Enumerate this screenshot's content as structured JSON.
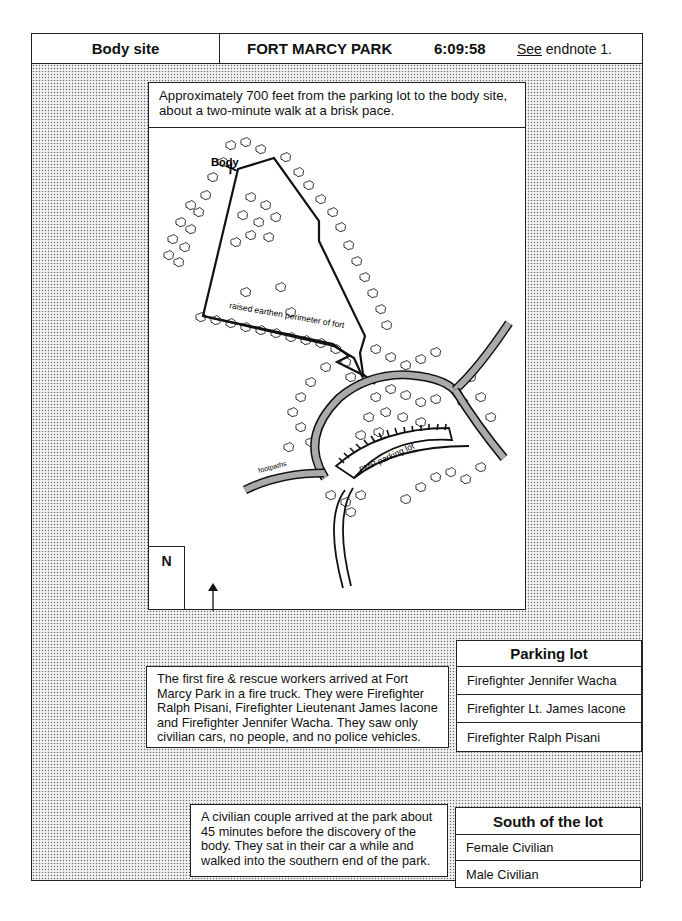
{
  "header": {
    "section": "Body site",
    "location": "FORT MARCY PARK",
    "time": "6:09:58",
    "endnote_link": "See",
    "endnote_rest": " endnote 1."
  },
  "map": {
    "caption": "Approximately 700 feet from the parking lot to the body site, about a two-minute walk at a brisk pace.",
    "labels": {
      "body": "Body",
      "body_marker": "X",
      "perimeter": "raised earthen perimeter of fort",
      "footpaths": "footpaths",
      "parking_lot": "FMP parking lot"
    },
    "north_label": "N"
  },
  "firefighters": {
    "description": "The first fire & rescue workers arrived at Fort Marcy Park in a fire truck.  They were Firefighter Ralph Pisani, Firefighter Lieutenant James Iacone and Firefighter Jennifer Wacha.  They saw only civilian cars, no people, and no police vehicles.",
    "table": {
      "title": "Parking lot",
      "rows": [
        "Firefighter Jennifer Wacha",
        "Firefighter Lt. James Iacone",
        "Firefighter Ralph Pisani"
      ]
    }
  },
  "civilians": {
    "description": "A civilian couple arrived at the park about 45 minutes before the discovery of the body.  They sat in their car a while and walked into the southern end of the park.",
    "table": {
      "title": "South of the lot",
      "rows": [
        "Female Civilian",
        "Male Civilian"
      ]
    }
  }
}
